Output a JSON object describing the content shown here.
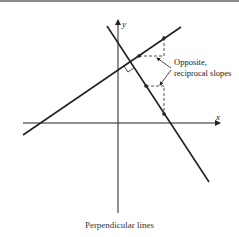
{
  "diagram": {
    "title": "Perpendicular lines",
    "axes": {
      "x_label": "x",
      "y_label": "y"
    },
    "annotation": {
      "line1": "Opposite,",
      "line2": "reciprocal slopes"
    },
    "lines": [
      {
        "name": "positive-slope-line",
        "from": [
          23,
          135
        ],
        "to": [
          181,
          27
        ]
      },
      {
        "name": "negative-slope-line",
        "from": [
          107,
          26
        ],
        "to": [
          209,
          182
        ]
      }
    ],
    "colors": {
      "ink": "#222222",
      "border": "#8a8a8a",
      "background": "#ffffff"
    }
  }
}
